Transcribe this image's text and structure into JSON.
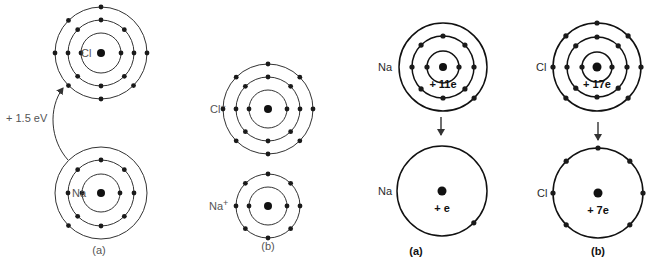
{
  "figure": {
    "left_panel": {
      "energy_label": "+ 1.5 eV",
      "atoms": [
        {
          "id": "cl-neutral-a",
          "label": "Cl",
          "cx": 101,
          "cy": 53,
          "nucleus_r": 4,
          "shells": [
            {
              "r": 20,
              "electron_angles": [
                0,
                180
              ]
            },
            {
              "r": 33,
              "electron_angles": [
                0,
                45,
                90,
                135,
                180,
                225,
                270,
                315
              ]
            },
            {
              "r": 46,
              "electron_angles": [
                0,
                90,
                135,
                180,
                225,
                270,
                315
              ]
            }
          ],
          "label_x": 81,
          "label_y": 57
        },
        {
          "id": "na-neutral-a",
          "label": "Na",
          "cx": 101,
          "cy": 193,
          "nucleus_r": 4,
          "shells": [
            {
              "r": 19,
              "electron_angles": [
                0,
                180
              ]
            },
            {
              "r": 33,
              "electron_angles": [
                0,
                45,
                90,
                135,
                180,
                225,
                270,
                315
              ]
            },
            {
              "r": 46,
              "electron_angles": [
                225
              ]
            }
          ],
          "label_x": 72,
          "label_y": 197
        },
        {
          "id": "cl-ion-b",
          "label": "Cl",
          "label_sup": "−",
          "cx": 268,
          "cy": 109,
          "nucleus_r": 4,
          "shells": [
            {
              "r": 19,
              "electron_angles": [
                0,
                180
              ]
            },
            {
              "r": 32,
              "electron_angles": [
                0,
                45,
                90,
                135,
                180,
                225,
                270,
                315
              ]
            },
            {
              "r": 45,
              "electron_angles": [
                0,
                45,
                90,
                135,
                180,
                225,
                270,
                315
              ]
            }
          ],
          "label_x": 210,
          "label_y": 113
        },
        {
          "id": "na-ion-b",
          "label": "Na",
          "label_sup": "+",
          "cx": 268,
          "cy": 206,
          "nucleus_r": 4,
          "shells": [
            {
              "r": 19,
              "electron_angles": [
                0,
                180
              ]
            },
            {
              "r": 32,
              "electron_angles": [
                0,
                45,
                90,
                135,
                180,
                225,
                270,
                315
              ]
            }
          ],
          "label_x": 209,
          "label_y": 210
        }
      ],
      "captions": [
        {
          "text": "(a)",
          "x": 99,
          "y": 254
        },
        {
          "text": "(b)",
          "x": 268,
          "y": 250
        }
      ]
    },
    "right_panel": {
      "atoms": [
        {
          "id": "na-core-a",
          "label": "Na",
          "charge_label": "+ 11e",
          "cx": 443,
          "cy": 67,
          "nucleus_r": 4,
          "shells": [
            {
              "r": 16,
              "electron_angles": [
                0,
                180
              ]
            },
            {
              "r": 31,
              "electron_angles": [
                0,
                45,
                90,
                135,
                180,
                225,
                270,
                315
              ]
            },
            {
              "r": 44,
              "electron_angles": [
                315
              ]
            }
          ],
          "label_x": 378,
          "label_y": 71
        },
        {
          "id": "na-effective-a",
          "label": "Na",
          "charge_label": "+ e",
          "cx": 442,
          "cy": 191,
          "nucleus_r": 4.5,
          "shells": [
            {
              "r": 45,
              "electron_angles": [
                315
              ]
            }
          ],
          "label_x": 378,
          "label_y": 195
        },
        {
          "id": "cl-core-b",
          "label": "Cl",
          "charge_label": "+ 17e",
          "cx": 597,
          "cy": 67,
          "nucleus_r": 4.5,
          "shells": [
            {
              "r": 15,
              "electron_angles": [
                0,
                180
              ]
            },
            {
              "r": 30,
              "electron_angles": [
                0,
                45,
                90,
                135,
                180,
                225,
                270,
                315
              ]
            },
            {
              "r": 44,
              "electron_angles": [
                45,
                90,
                135,
                180,
                225,
                315,
                0
              ]
            }
          ],
          "label_x": 536,
          "label_y": 71
        },
        {
          "id": "cl-effective-b",
          "label": "Cl",
          "charge_label": "+ 7e",
          "cx": 598,
          "cy": 193,
          "nucleus_r": 4.5,
          "shells": [
            {
              "r": 45,
              "electron_angles": [
                45,
                90,
                135,
                180,
                225,
                315,
                0
              ]
            }
          ],
          "label_x": 537,
          "label_y": 197
        }
      ],
      "arrows": [
        {
          "x": 441,
          "y1": 117,
          "y2": 135
        },
        {
          "x": 598,
          "y1": 122,
          "y2": 140
        }
      ],
      "captions": [
        {
          "text": "(a)",
          "x": 416,
          "y": 255
        },
        {
          "text": "(b)",
          "x": 598,
          "y": 255
        }
      ]
    }
  },
  "colors": {
    "background": "#ffffff",
    "ink": "#1a1a1a",
    "light_label": "#555555"
  }
}
